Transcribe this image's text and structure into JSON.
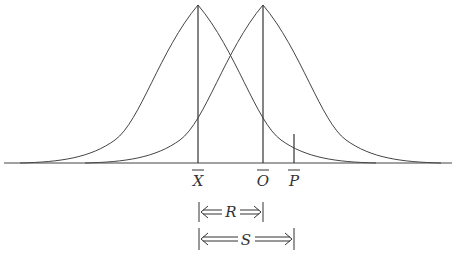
{
  "diagram": {
    "type": "two overlapping normal distribution curves",
    "markers": [
      {
        "id": "X",
        "label": "X",
        "bar": true,
        "x": 198
      },
      {
        "id": "O",
        "label": "O",
        "bar": true,
        "x": 263
      },
      {
        "id": "P",
        "label": "P",
        "bar": true,
        "x": 294
      }
    ],
    "brackets": [
      {
        "id": "R",
        "label": "R",
        "from": "X",
        "to": "O"
      },
      {
        "id": "S",
        "label": "S",
        "from": "X",
        "to": "P"
      }
    ],
    "colors": {
      "line": "#333333",
      "background": "#ffffff"
    }
  }
}
